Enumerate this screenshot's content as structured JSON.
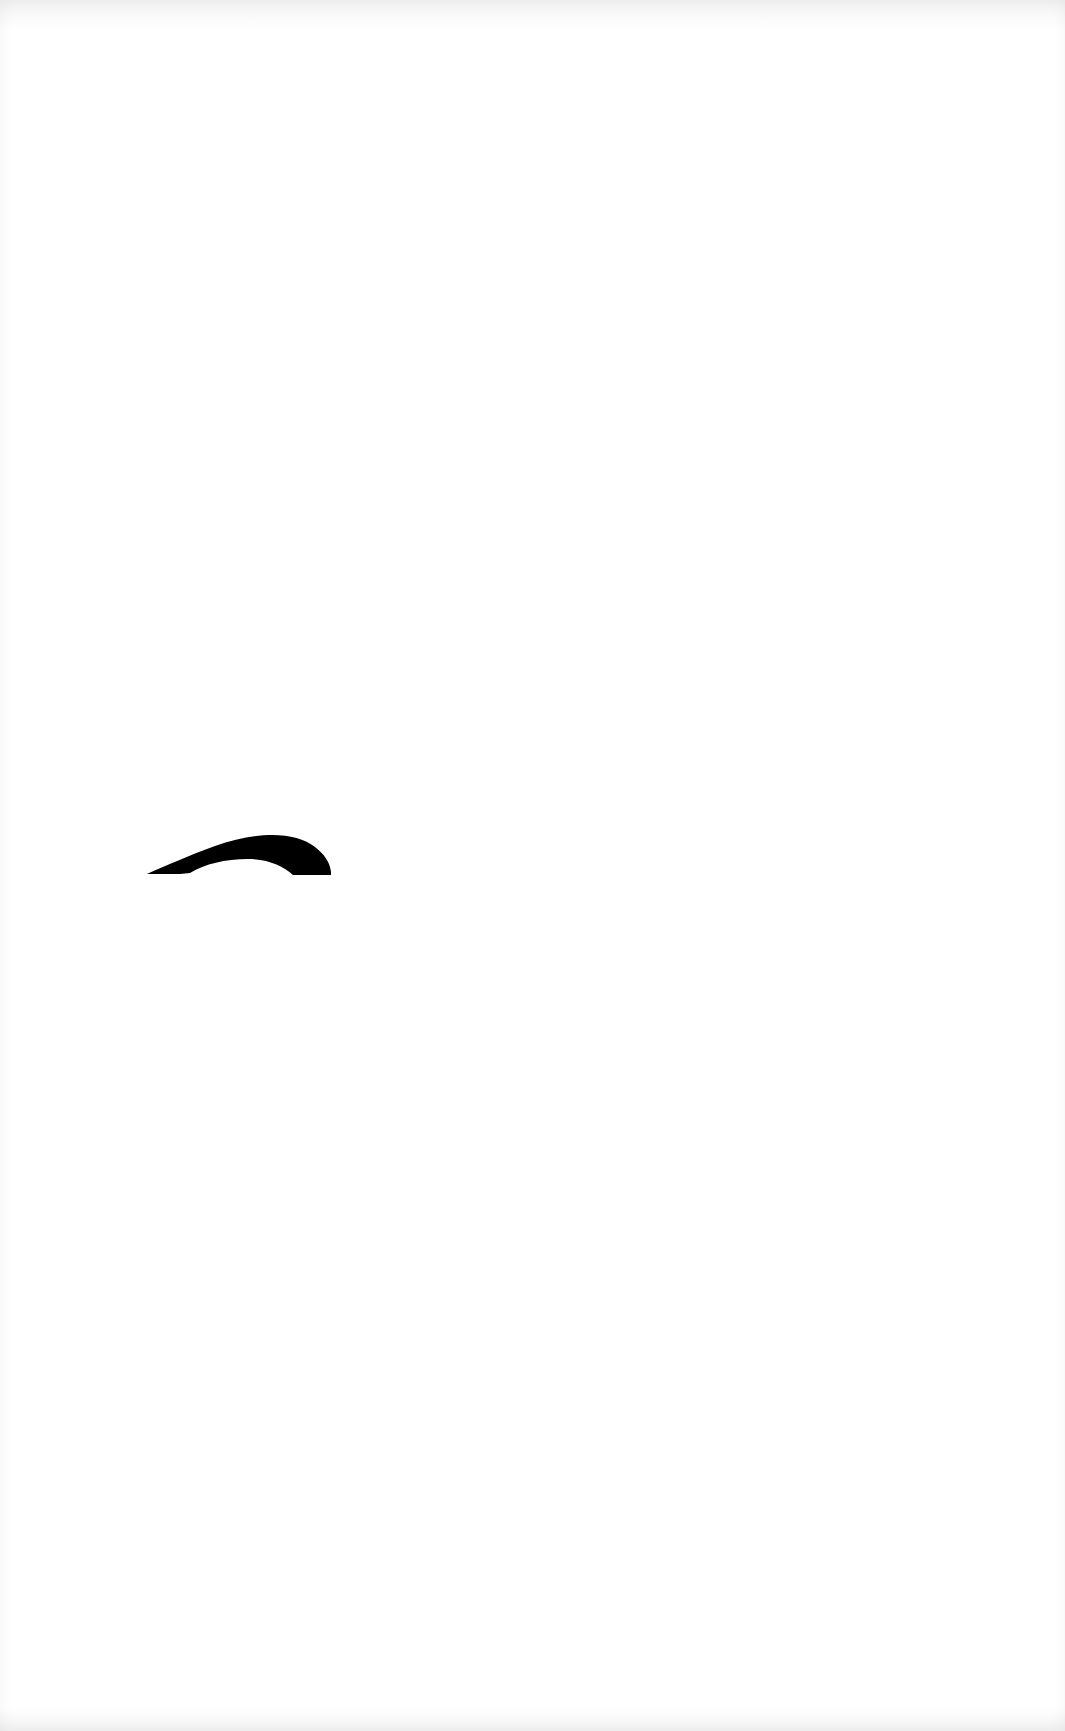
{
  "page": {
    "background_color": "#ffffff"
  },
  "drawing": {
    "shape": "arc-stroke",
    "color": "#000000"
  }
}
